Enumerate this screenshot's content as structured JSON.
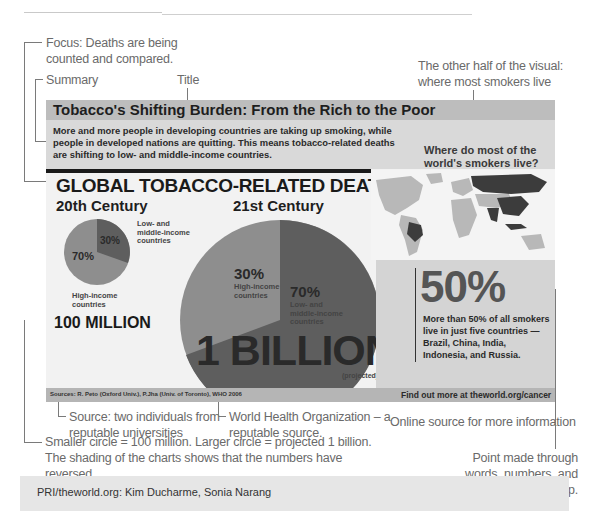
{
  "annotations": {
    "focus": "Focus: Deaths are being counted and compared.",
    "summary": "Summary",
    "title": "Title",
    "other_half": "The other half of the visual: where most smokers live",
    "source_individuals": "Source: two individuals from reputable universities",
    "who": "World Health Organization – a reputable source.",
    "online_source": "Online source for more information",
    "circles": "Smaller circle = 100 million. Larger circle = projected 1 billion. The shading of the charts shows that the numbers have reversed.",
    "point_made": "Point made through words, numbers, and shaded map."
  },
  "infographic": {
    "title": "Tobacco's Shifting Burden: From the Rich to the Poor",
    "summary": "More and more people in developing countries are taking up smoking, while people in developed nations are quitting. This means tobacco-related deaths are shifting to low- and middle-income countries.",
    "question": "Where do most of the world's smokers live?",
    "heading": "GLOBAL TOBACCO-RELATED DEATHS",
    "century20": {
      "label": "20th Century",
      "high_pct": "70%",
      "high_label": "High-income countries",
      "low_pct": "30%",
      "low_label": "Low- and middle-income countries",
      "total": "100 MILLION"
    },
    "century21": {
      "label": "21st Century",
      "high_pct": "30%",
      "high_label": "High-income countries",
      "low_pct": "70%",
      "low_label": "Low- and middle-income countries",
      "total": "1 BILLION",
      "note": "(projected)"
    },
    "stat": {
      "big": "50%",
      "text": "More than 50% of all smokers live in just five countries — Brazil, China, India, Indonesia, and Russia."
    },
    "sources": "Sources: R. Peto (Oxford Univ.), P.Jha (Univ. of Toronto), WHO 2006",
    "find_out": "Find out more at theworld.org/cancer"
  },
  "credit": "PRI/theworld.org: Kim Ducharme, Sonia Narang",
  "colors": {
    "pie_high": "#8e8e8e",
    "pie_low": "#5e5e5e",
    "map_highlight": "#3c3c3c",
    "map_base": "#b8b8b8"
  }
}
